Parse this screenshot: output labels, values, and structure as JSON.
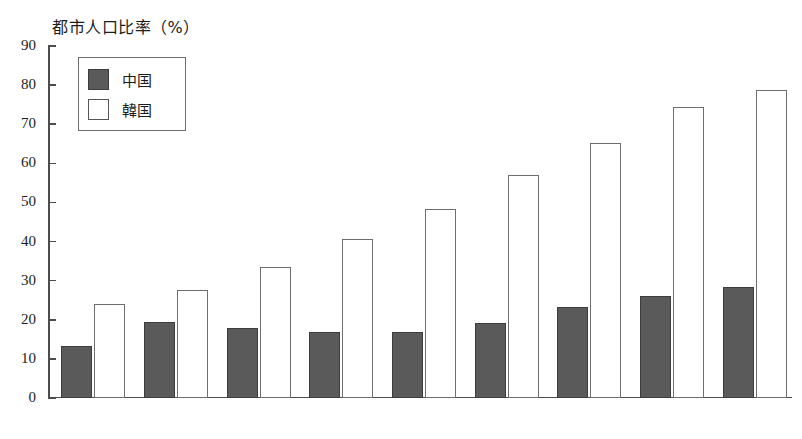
{
  "chart_data": {
    "type": "bar",
    "title": "都市人口比率（%）",
    "xlabel": "",
    "ylabel": "",
    "ylim": [
      0,
      90
    ],
    "yticks": [
      0,
      10,
      20,
      30,
      40,
      50,
      60,
      70,
      80,
      90
    ],
    "grid": false,
    "legend_position": "top-left",
    "categories": [
      "1955",
      "1960",
      "1965",
      "1970",
      "1975",
      "1980",
      "1985",
      "1990",
      "1995"
    ],
    "series": [
      {
        "name": "中国",
        "color": "#5a5a5a",
        "values": [
          13.2,
          19.5,
          18.0,
          17.0,
          17.0,
          19.2,
          23.3,
          26.2,
          28.5
        ]
      },
      {
        "name": "韓国",
        "color": "#ffffff",
        "values": [
          24.0,
          27.5,
          33.4,
          40.7,
          48.4,
          57.0,
          65.2,
          74.4,
          78.7
        ]
      }
    ]
  },
  "axis": {
    "y_tick_labels": [
      "90",
      "80",
      "70",
      "60",
      "50",
      "40",
      "30",
      "20",
      "10",
      "0"
    ]
  }
}
